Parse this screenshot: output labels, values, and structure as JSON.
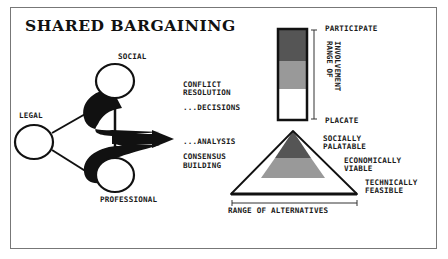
{
  "title": "SHARED BARGAINING",
  "stakeholders": {
    "social": "SOCIAL",
    "legal": "LEGAL",
    "professional": "PROFESSIONAL"
  },
  "process": {
    "conflict_line1": "CONFLICT",
    "conflict_line2": "RESOLUTION",
    "decisions": "...DECISIONS",
    "analysis": "...ANALYSIS",
    "consensus_line1": "CONSENSUS",
    "consensus_line2": "BUILDING"
  },
  "involvement": {
    "top": "PARTICIPATE",
    "bottom": "PLACATE",
    "axis_line1": "RANGE OF",
    "axis_line2": "INVOLVEMENT",
    "colors": {
      "high": "#555555",
      "mid": "#999999",
      "low": "#ffffff"
    }
  },
  "alternatives": {
    "top_line1": "SOCIALLY",
    "top_line2": "PALATABLE",
    "mid_line1": "ECONOMICALLY",
    "mid_line2": "VIABLE",
    "base_line1": "TECHNICALLY",
    "base_line2": "FEASIBLE",
    "axis": "RANGE OF ALTERNATIVES",
    "colors": {
      "top": "#555555",
      "mid": "#999999",
      "base": "#ffffff"
    }
  }
}
